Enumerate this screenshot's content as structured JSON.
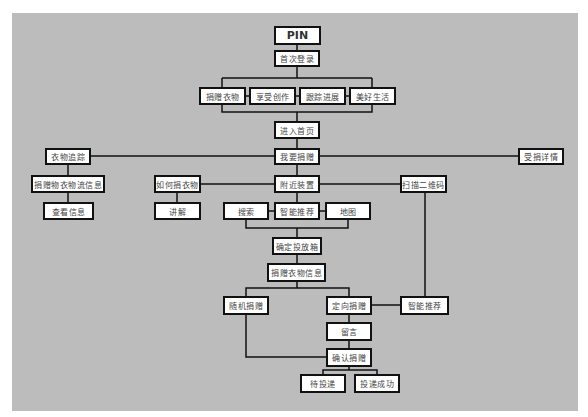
{
  "diagram": {
    "type": "flowchart",
    "background_color": "#bcbcbc",
    "node_border_color": "#111111",
    "line_color": "#111111",
    "nodes": [
      {
        "id": "pin",
        "label": "PIN",
        "x": 274,
        "y": 26,
        "w": 47,
        "h": 19
      },
      {
        "id": "first_login",
        "label": "首次登录",
        "x": 274,
        "y": 50,
        "w": 46,
        "h": 17
      },
      {
        "id": "donate_clothes",
        "label": "捐赠衣物",
        "x": 199,
        "y": 87,
        "w": 47,
        "h": 18
      },
      {
        "id": "enjoy_create",
        "label": "享受创作",
        "x": 249,
        "y": 87,
        "w": 47,
        "h": 18
      },
      {
        "id": "track_progress",
        "label": "跟踪进展",
        "x": 299,
        "y": 87,
        "w": 47,
        "h": 18
      },
      {
        "id": "good_life",
        "label": "美好生活",
        "x": 349,
        "y": 87,
        "w": 47,
        "h": 18
      },
      {
        "id": "enter_home",
        "label": "进入首页",
        "x": 274,
        "y": 121,
        "w": 46,
        "h": 18
      },
      {
        "id": "i_want_donate",
        "label": "我要捐赠",
        "x": 274,
        "y": 148,
        "w": 46,
        "h": 17
      },
      {
        "id": "clothes_tracking",
        "label": "衣物追踪",
        "x": 45,
        "y": 148,
        "w": 46,
        "h": 17
      },
      {
        "id": "received_details",
        "label": "受捐详情",
        "x": 518,
        "y": 148,
        "w": 46,
        "h": 17
      },
      {
        "id": "logistics_info",
        "label": "捐赠物衣物流信息",
        "x": 31,
        "y": 175,
        "w": 74,
        "h": 18
      },
      {
        "id": "how_to_donate",
        "label": "如何捐衣物",
        "x": 154,
        "y": 175,
        "w": 47,
        "h": 18
      },
      {
        "id": "nearby_devices",
        "label": "附近装置",
        "x": 274,
        "y": 175,
        "w": 46,
        "h": 18
      },
      {
        "id": "scan_qr",
        "label": "扫描二维码",
        "x": 400,
        "y": 175,
        "w": 47,
        "h": 18
      },
      {
        "id": "view_info",
        "label": "查看信息",
        "x": 43,
        "y": 202,
        "w": 51,
        "h": 18
      },
      {
        "id": "explain",
        "label": "讲解",
        "x": 154,
        "y": 202,
        "w": 47,
        "h": 18
      },
      {
        "id": "search",
        "label": "搜索",
        "x": 223,
        "y": 202,
        "w": 46,
        "h": 18
      },
      {
        "id": "smart_recommend_1",
        "label": "智能推荐",
        "x": 274,
        "y": 202,
        "w": 46,
        "h": 18
      },
      {
        "id": "map",
        "label": "地图",
        "x": 325,
        "y": 202,
        "w": 46,
        "h": 18
      },
      {
        "id": "confirm_box",
        "label": "确定投放箱",
        "x": 272,
        "y": 237,
        "w": 50,
        "h": 18
      },
      {
        "id": "donation_info",
        "label": "捐赠衣物信息",
        "x": 267,
        "y": 263,
        "w": 59,
        "h": 19
      },
      {
        "id": "random_donate",
        "label": "随机捐赠",
        "x": 223,
        "y": 296,
        "w": 46,
        "h": 19
      },
      {
        "id": "directed_donate",
        "label": "定向捐赠",
        "x": 326,
        "y": 296,
        "w": 46,
        "h": 19
      },
      {
        "id": "smart_recommend_2",
        "label": "智能推荐",
        "x": 400,
        "y": 296,
        "w": 49,
        "h": 19
      },
      {
        "id": "message",
        "label": "留言",
        "x": 326,
        "y": 322,
        "w": 46,
        "h": 19
      },
      {
        "id": "confirm_donate",
        "label": "确认捐赠",
        "x": 326,
        "y": 348,
        "w": 46,
        "h": 19
      },
      {
        "id": "pending_delivery",
        "label": "待投递",
        "x": 300,
        "y": 374,
        "w": 46,
        "h": 19
      },
      {
        "id": "delivery_success",
        "label": "投递成功",
        "x": 354,
        "y": 374,
        "w": 46,
        "h": 19
      }
    ],
    "edges": [
      {
        "from": "pin",
        "to": "first_login",
        "points": [
          [
            297,
            45
          ],
          [
            297,
            50
          ]
        ]
      },
      {
        "from": "first_login",
        "to": "bracket_top",
        "points": [
          [
            297,
            67
          ],
          [
            297,
            78
          ]
        ]
      },
      {
        "from": "bracket_top",
        "to": "bracket",
        "points": [
          [
            222,
            78
          ],
          [
            372,
            78
          ]
        ]
      },
      {
        "from": "bracket_top",
        "to": "donate_clothes",
        "points": [
          [
            222,
            78
          ],
          [
            222,
            87
          ]
        ]
      },
      {
        "from": "bracket_top",
        "to": "good_life",
        "points": [
          [
            372,
            78
          ],
          [
            372,
            87
          ]
        ]
      },
      {
        "from": "bracket_bottom",
        "to": "bracket",
        "points": [
          [
            222,
            105
          ],
          [
            222,
            112
          ],
          [
            372,
            112
          ],
          [
            372,
            105
          ]
        ]
      },
      {
        "from": "donate_clothes",
        "to": "enjoy_create",
        "points": [
          [
            246,
            96
          ],
          [
            249,
            96
          ]
        ]
      },
      {
        "from": "enjoy_create",
        "to": "track_progress",
        "points": [
          [
            296,
            96
          ],
          [
            299,
            96
          ]
        ]
      },
      {
        "from": "track_progress",
        "to": "good_life",
        "points": [
          [
            346,
            96
          ],
          [
            349,
            96
          ]
        ]
      },
      {
        "from": "bracket_bottom",
        "to": "enter_home",
        "points": [
          [
            297,
            112
          ],
          [
            297,
            121
          ]
        ]
      },
      {
        "from": "enter_home",
        "to": "i_want_donate",
        "points": [
          [
            297,
            139
          ],
          [
            297,
            148
          ]
        ]
      },
      {
        "from": "clothes_tracking",
        "to": "received_details",
        "points": [
          [
            91,
            156
          ],
          [
            518,
            156
          ]
        ]
      },
      {
        "from": "clothes_tracking",
        "to": "logistics_info",
        "points": [
          [
            68,
            165
          ],
          [
            68,
            175
          ]
        ]
      },
      {
        "from": "logistics_info",
        "to": "view_info",
        "points": [
          [
            68,
            193
          ],
          [
            68,
            202
          ]
        ]
      },
      {
        "from": "i_want_donate",
        "to": "nearby_devices",
        "points": [
          [
            297,
            165
          ],
          [
            297,
            175
          ]
        ]
      },
      {
        "from": "how_to_donate",
        "to": "scan_qr",
        "points": [
          [
            201,
            184
          ],
          [
            400,
            184
          ]
        ]
      },
      {
        "from": "how_to_donate",
        "to": "explain",
        "points": [
          [
            177,
            193
          ],
          [
            177,
            202
          ]
        ]
      },
      {
        "from": "nearby_devices",
        "to": "smart_recommend_1",
        "points": [
          [
            297,
            193
          ],
          [
            297,
            202
          ]
        ]
      },
      {
        "from": "search",
        "to": "smart_recommend_1",
        "points": [
          [
            269,
            211
          ],
          [
            274,
            211
          ]
        ]
      },
      {
        "from": "smart_recommend_1",
        "to": "map",
        "points": [
          [
            320,
            211
          ],
          [
            325,
            211
          ]
        ]
      },
      {
        "from": "search",
        "to": "confirm_box",
        "points": [
          [
            246,
            220
          ],
          [
            246,
            228
          ],
          [
            348,
            228
          ],
          [
            348,
            220
          ]
        ]
      },
      {
        "from": "group",
        "to": "confirm_box",
        "points": [
          [
            297,
            228
          ],
          [
            297,
            237
          ]
        ]
      },
      {
        "from": "confirm_box",
        "to": "donation_info",
        "points": [
          [
            297,
            255
          ],
          [
            297,
            263
          ]
        ]
      },
      {
        "from": "donation_info",
        "to": "branch",
        "points": [
          [
            297,
            282
          ],
          [
            297,
            288
          ]
        ]
      },
      {
        "from": "branch",
        "to": "random_donate",
        "points": [
          [
            246,
            296
          ],
          [
            246,
            288
          ],
          [
            349,
            288
          ],
          [
            349,
            296
          ]
        ]
      },
      {
        "from": "scan_qr",
        "to": "smart_recommend_2",
        "points": [
          [
            425,
            193
          ],
          [
            425,
            296
          ]
        ]
      },
      {
        "from": "directed_donate",
        "to": "smart_recommend_2",
        "points": [
          [
            372,
            305
          ],
          [
            400,
            305
          ]
        ]
      },
      {
        "from": "directed_donate",
        "to": "message",
        "points": [
          [
            349,
            315
          ],
          [
            349,
            322
          ]
        ]
      },
      {
        "from": "message",
        "to": "confirm_donate",
        "points": [
          [
            349,
            341
          ],
          [
            349,
            348
          ]
        ]
      },
      {
        "from": "random_donate",
        "to": "confirm_donate",
        "points": [
          [
            246,
            315
          ],
          [
            246,
            357
          ],
          [
            326,
            357
          ]
        ]
      },
      {
        "from": "confirm_donate",
        "to": "deliveries",
        "points": [
          [
            349,
            367
          ],
          [
            349,
            370
          ]
        ]
      },
      {
        "from": "deliveries",
        "to": "pending_delivery",
        "points": [
          [
            323,
            374
          ],
          [
            323,
            370
          ],
          [
            377,
            370
          ],
          [
            377,
            374
          ]
        ]
      }
    ]
  }
}
